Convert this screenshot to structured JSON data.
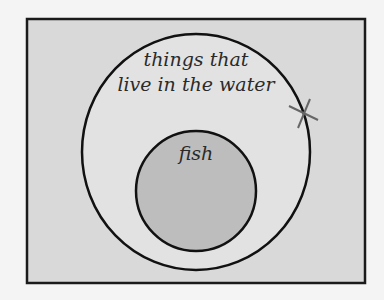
{
  "diagram": {
    "type": "venn",
    "outer_set": {
      "label_line1": "things that",
      "label_line2": "live in the water"
    },
    "inner_set": {
      "label": "fish"
    },
    "marker": {
      "symbol": "X",
      "position": "on outer circle boundary, upper right"
    },
    "colors": {
      "background": "#f4f4f4",
      "frame_fill": "#d9d9d9",
      "outer_fill": "#e2e2e2",
      "inner_fill": "#bdbdbd",
      "stroke": "#1a1a1a",
      "marker": "#666666"
    }
  }
}
